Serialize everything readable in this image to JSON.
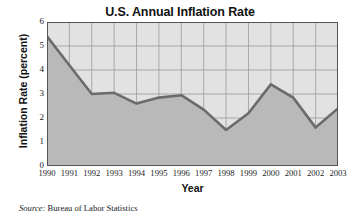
{
  "chart_data": {
    "type": "area",
    "title": "U.S. Annual Inflation Rate",
    "xlabel": "Year",
    "ylabel": "Inflation Rate (percent)",
    "categories": [
      "1990",
      "1991",
      "1992",
      "1993",
      "1994",
      "1995",
      "1996",
      "1997",
      "1998",
      "1999",
      "2000",
      "2001",
      "2002",
      "2003"
    ],
    "values": [
      5.4,
      4.2,
      3.0,
      3.05,
      2.6,
      2.85,
      2.95,
      2.35,
      1.5,
      2.2,
      3.4,
      2.85,
      1.6,
      2.4
    ],
    "ylim": [
      0,
      6
    ],
    "yticks": [
      "0",
      "1",
      "2",
      "3",
      "4",
      "5",
      "6"
    ],
    "ytick_values": [
      0,
      1,
      2,
      3,
      4,
      5,
      6
    ],
    "grid": true,
    "legend": "none",
    "line_color": "#6b6b6b",
    "fill_color": "#b9b9b9",
    "plot_bg_color": "#e2e2e2",
    "grid_color": "#9a9a9a",
    "border_color": "#555555"
  },
  "source": {
    "label": "Source:",
    "text": "Bureau of Labor Statistics"
  }
}
